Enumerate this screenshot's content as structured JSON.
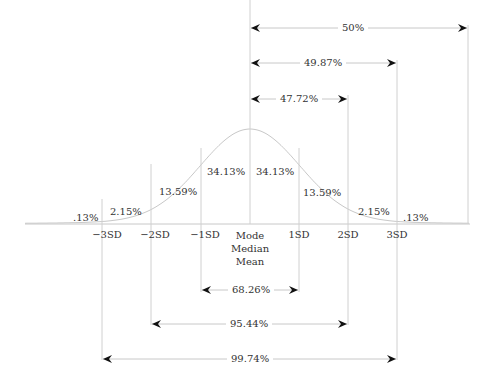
{
  "diagram": {
    "colors": {
      "line": "#c8c8c8",
      "arrow": "#111111",
      "text": "#333333"
    },
    "sd_labels": [
      "−3SD",
      "−2SD",
      "−1SD",
      "1SD",
      "2SD",
      "3SD"
    ],
    "center_labels": [
      "Mode",
      "Median",
      "Mean"
    ],
    "region_percentages": {
      "left_tail": ".13%",
      "left_3": "2.15%",
      "left_2": "13.59%",
      "left_1": "34.13%",
      "right_1": "34.13%",
      "right_2": "13.59%",
      "right_3": "2.15%",
      "right_tail": ".13%"
    },
    "top_spans": [
      {
        "label": "50%",
        "from": "Mean",
        "to": "end"
      },
      {
        "label": "49.87%",
        "from": "Mean",
        "to": "3SD"
      },
      {
        "label": "47.72%",
        "from": "Mean",
        "to": "2SD"
      }
    ],
    "bottom_spans": [
      {
        "label": "68.26%",
        "from": "−1SD",
        "to": "1SD"
      },
      {
        "label": "95.44%",
        "from": "−2SD",
        "to": "2SD"
      },
      {
        "label": "99.74%",
        "from": "−3SD",
        "to": "3SD"
      }
    ]
  }
}
